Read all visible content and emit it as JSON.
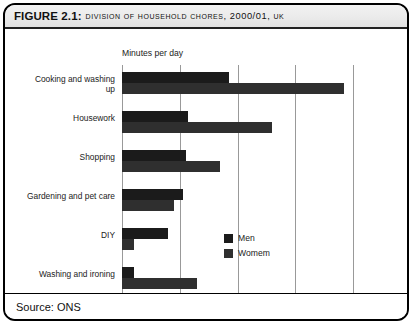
{
  "figure": {
    "label": "FIGURE 2.1:",
    "caption": "Division of household chores, 2000/01, UK",
    "source": "Source: ONS"
  },
  "legend": {
    "position": "inside-right",
    "entries": [
      {
        "name": "Men",
        "color": "#1b1b1b"
      },
      {
        "name": "Womem",
        "color": "#2f2f2f"
      }
    ]
  },
  "chart_data": {
    "type": "bar",
    "orientation": "horizontal",
    "title": "Division of household chores, 2000/01, UK",
    "xlabel": "Minutes per day",
    "ylabel": "",
    "xlim": [
      0,
      80
    ],
    "xticks": [
      0,
      20,
      40,
      60,
      80
    ],
    "xtick_labels": [
      "0",
      "20",
      "40",
      "60",
      "80"
    ],
    "grid": "vertical",
    "categories": [
      "Cooking and washing up",
      "Housework",
      "Shopping",
      "Gardening and pet care",
      "DIY",
      "Washing and ironing"
    ],
    "series": [
      {
        "name": "Men",
        "color": "#1b1b1b",
        "values": [
          37,
          23,
          22,
          21,
          16,
          4
        ]
      },
      {
        "name": "Womem",
        "color": "#2f2f2f",
        "values": [
          77,
          52,
          34,
          18,
          4,
          26
        ]
      }
    ]
  }
}
